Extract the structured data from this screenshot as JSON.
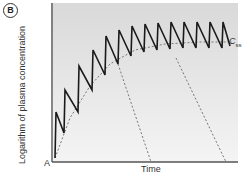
{
  "panel_label": "B",
  "chart_data": {
    "type": "line",
    "title": "",
    "xlabel": "Time",
    "ylabel": "Logarithm of plasma concentration",
    "origin_label": "A",
    "grid": false,
    "legend": "none",
    "annotations": [
      {
        "text": "C",
        "subscript": "ss",
        "meaning": "steady-state concentration",
        "position": "right edge at plateau"
      }
    ],
    "series": [
      {
        "name": "Plasma concentration (repeated dosing)",
        "style": "solid black sawtooth",
        "dose_count": 13,
        "points_px": [
          [
            55,
            158
          ],
          [
            56,
            112
          ],
          [
            64,
            133
          ],
          [
            65,
            90
          ],
          [
            78,
            112
          ],
          [
            79,
            66
          ],
          [
            92,
            90
          ],
          [
            93,
            50
          ],
          [
            105,
            75
          ],
          [
            106,
            36
          ],
          [
            118,
            64
          ],
          [
            119,
            30
          ],
          [
            131,
            56
          ],
          [
            132,
            26
          ],
          [
            144,
            52
          ],
          [
            145,
            24
          ],
          [
            157,
            50
          ],
          [
            158,
            23
          ],
          [
            170,
            49
          ],
          [
            171,
            22
          ],
          [
            183,
            48
          ],
          [
            184,
            22
          ],
          [
            196,
            48
          ],
          [
            197,
            22
          ],
          [
            209,
            48
          ],
          [
            210,
            22
          ],
          [
            222,
            48
          ],
          [
            223,
            22
          ],
          [
            230,
            46
          ]
        ]
      },
      {
        "name": "Accumulation curve (approach to Css)",
        "style": "dashed grey",
        "points_px": [
          [
            55,
            158
          ],
          [
            70,
            118
          ],
          [
            90,
            86
          ],
          [
            110,
            64
          ],
          [
            135,
            50
          ],
          [
            165,
            44
          ],
          [
            200,
            42
          ],
          [
            232,
            42
          ]
        ]
      },
      {
        "name": "Decay after stopping (early)",
        "style": "dashed grey",
        "points_px": [
          [
            118,
            64
          ],
          [
            151,
            162
          ]
        ]
      },
      {
        "name": "Decay after stopping (late)",
        "style": "dashed grey",
        "points_px": [
          [
            176,
            58
          ],
          [
            226,
            162
          ]
        ]
      }
    ],
    "css_level_px": 42,
    "plot_area_px": {
      "left": 51,
      "top": 3,
      "right": 238,
      "bottom": 162
    }
  }
}
